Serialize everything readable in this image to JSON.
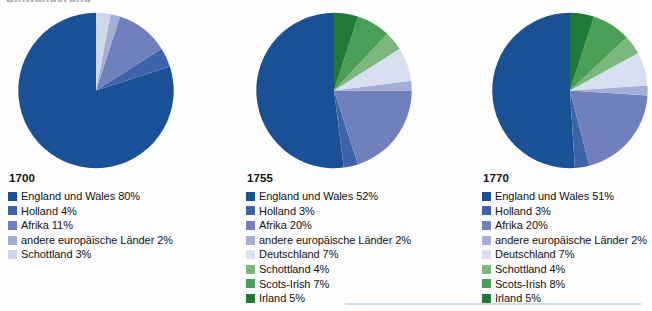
{
  "document": {
    "cut_off_heading": "Einwanderung",
    "background_color": "#fefefe",
    "rule_color": "#cfdcea"
  },
  "palette": {
    "england": "#1a5196",
    "holland": "#3e63a8",
    "afrika": "#6f80bd",
    "andere": "#a3aed6",
    "schottland_blue": "#cfd8ea",
    "deutschland": "#d7dff0",
    "schottland_green": "#7cb87e",
    "scots_irish": "#4a9e55",
    "irland": "#1f7a38"
  },
  "chart_data": [
    {
      "type": "pie",
      "title": "1700",
      "categories": [
        "England und Wales",
        "Holland",
        "Afrika",
        "andere europäische Länder",
        "Schottland"
      ],
      "values": [
        80,
        4,
        11,
        2,
        3
      ],
      "value_suffix": "%",
      "colors": [
        "#1a5196",
        "#3e63a8",
        "#6f80bd",
        "#a3aed6",
        "#cfd8ea"
      ],
      "legend": {
        "position": "below",
        "entries": [
          {
            "label": "England und Wales 80%",
            "color": "#1a5196"
          },
          {
            "label": "Holland 4%",
            "color": "#3e63a8"
          },
          {
            "label": "Afrika 11%",
            "color": "#6f80bd"
          },
          {
            "label": "andere europäische Länder 2%",
            "color": "#a3aed6"
          },
          {
            "label": "Schottland 3%",
            "color": "#cfd8ea"
          }
        ]
      }
    },
    {
      "type": "pie",
      "title": "1755",
      "categories": [
        "England und Wales",
        "Holland",
        "Afrika",
        "andere europäische Länder",
        "Deutschland",
        "Schottland",
        "Scots-Irish",
        "Irland"
      ],
      "values": [
        52,
        3,
        20,
        2,
        7,
        4,
        7,
        5
      ],
      "value_suffix": "%",
      "colors": [
        "#1a5196",
        "#3e63a8",
        "#6f80bd",
        "#a3aed6",
        "#d7dff0",
        "#7cb87e",
        "#4a9e55",
        "#1f7a38"
      ],
      "legend": {
        "position": "below",
        "entries": [
          {
            "label": "England und Wales 52%",
            "color": "#1a5196"
          },
          {
            "label": "Holland 3%",
            "color": "#3e63a8"
          },
          {
            "label": "Afrika 20%",
            "color": "#6f80bd"
          },
          {
            "label": "andere europäische Länder 2%",
            "color": "#a3aed6"
          },
          {
            "label": "Deutschland 7%",
            "color": "#d7dff0"
          },
          {
            "label": "Schottland 4%",
            "color": "#7cb87e"
          },
          {
            "label": "Scots-Irish 7%",
            "color": "#4a9e55"
          },
          {
            "label": "Irland 5%",
            "color": "#1f7a38"
          }
        ]
      }
    },
    {
      "type": "pie",
      "title": "1770",
      "categories": [
        "England und Wales",
        "Holland",
        "Afrika",
        "andere europäische Länder",
        "Deutschland",
        "Schottland",
        "Scots-Irish",
        "Irland"
      ],
      "values": [
        51,
        3,
        20,
        2,
        7,
        4,
        8,
        5
      ],
      "value_suffix": "%",
      "colors": [
        "#1a5196",
        "#3e63a8",
        "#6f80bd",
        "#a3aed6",
        "#d7dff0",
        "#7cb87e",
        "#4a9e55",
        "#1f7a38"
      ],
      "legend": {
        "position": "below",
        "entries": [
          {
            "label": "England und Wales 51%",
            "color": "#1a5196"
          },
          {
            "label": "Holland 3%",
            "color": "#3e63a8"
          },
          {
            "label": "Afrika 20%",
            "color": "#6f80bd"
          },
          {
            "label": "andere europäische Länder 2%",
            "color": "#a3aed6"
          },
          {
            "label": "Deutschland 7%",
            "color": "#d7dff0"
          },
          {
            "label": "Schottland 4%",
            "color": "#7cb87e"
          },
          {
            "label": "Scots-Irish 8%",
            "color": "#4a9e55"
          },
          {
            "label": "Irland 5%",
            "color": "#1f7a38"
          }
        ]
      }
    }
  ]
}
